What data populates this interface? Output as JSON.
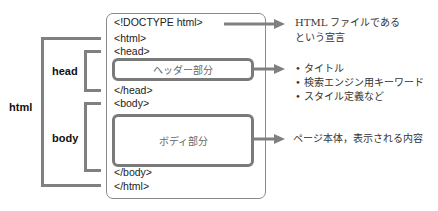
{
  "labels": {
    "html": "html",
    "head": "head",
    "body": "body"
  },
  "code_lines": {
    "doctype": "<!DOCTYPE html>",
    "html_open": "<html>",
    "head_open": "<head>",
    "head_close": "</head>",
    "body_open": "<body>",
    "body_close": "</body>",
    "html_close": "</html>"
  },
  "sections": {
    "header": "ヘッダー部分",
    "body": "ボディ部分"
  },
  "annotations": {
    "doctype": [
      "HTML ファイルである",
      "という宣言"
    ],
    "header_items": [
      "タイトル",
      "検索エンジン用キーワード",
      "スタイル定義など"
    ],
    "body": "ページ本体，表示される内容"
  },
  "colors": {
    "bracket": "#808080",
    "box_border": "#7a7a7a",
    "outer_border": "#8a8a8a"
  }
}
